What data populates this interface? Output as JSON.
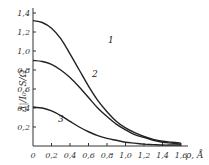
{
  "chart_data": {
    "type": "line",
    "title": "",
    "xlabel": "ρ, Å",
    "ylabel": "Δ|/I₀, S/Ω",
    "xlim": [
      0,
      1.6
    ],
    "ylim": [
      0,
      1.4
    ],
    "grid": false,
    "legend": "inline curve numbers",
    "x_ticks": [
      "0",
      "0,2",
      "0,4",
      "0,6",
      "0,8",
      "1,0",
      "1,2",
      "1,4",
      "1,6"
    ],
    "y_ticks": [
      "0,2",
      "0,4",
      "0,6",
      "0,8",
      "1,0",
      "1,2",
      "1,4"
    ],
    "x": [
      0,
      0.1,
      0.2,
      0.3,
      0.4,
      0.5,
      0.6,
      0.7,
      0.8,
      0.9,
      1.0,
      1.1,
      1.2,
      1.3,
      1.4,
      1.5,
      1.6
    ],
    "series": [
      {
        "name": "1",
        "values": [
          1.32,
          1.3,
          1.24,
          1.13,
          0.97,
          0.8,
          0.63,
          0.48,
          0.36,
          0.26,
          0.19,
          0.14,
          0.1,
          0.07,
          0.05,
          0.04,
          0.03
        ]
      },
      {
        "name": "2",
        "values": [
          0.9,
          0.89,
          0.86,
          0.8,
          0.72,
          0.62,
          0.51,
          0.4,
          0.31,
          0.23,
          0.17,
          0.12,
          0.09,
          0.06,
          0.04,
          0.03,
          0.02
        ]
      },
      {
        "name": "3",
        "values": [
          0.41,
          0.4,
          0.37,
          0.32,
          0.26,
          0.2,
          0.15,
          0.11,
          0.08,
          0.06,
          0.04,
          0.03,
          0.02,
          0.015,
          0.01,
          0.01,
          0.01
        ]
      }
    ]
  },
  "labels": {
    "curve1": "1",
    "curve2": "2",
    "curve3": "3",
    "xlabel": "ρ, Å",
    "ylabel": "Δ|/I₀, S/Ω"
  }
}
